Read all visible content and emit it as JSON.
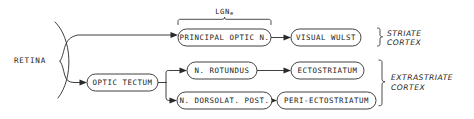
{
  "diagram": {
    "colors": {
      "ink": "#2a2a2a",
      "background": "#ffffff"
    },
    "source_node": {
      "label": "RETINA",
      "shape": "retina-arc"
    },
    "nodes": [
      {
        "id": "principal-optic-n",
        "label": "PRINCIPAL OPTIC N.",
        "x": 178,
        "y": 29,
        "w": 93,
        "h": 17
      },
      {
        "id": "visual-wulst",
        "label": "VISUAL WULST",
        "x": 291,
        "y": 29,
        "w": 70,
        "h": 17
      },
      {
        "id": "optic-tectum",
        "label": "OPTIC TECTUM",
        "x": 87,
        "y": 74,
        "w": 71,
        "h": 17
      },
      {
        "id": "n-rotundus",
        "label": "N. ROTUNDUS",
        "x": 187,
        "y": 62,
        "w": 70,
        "h": 17
      },
      {
        "id": "ectostriatum",
        "label": "ECTOSTRIATUM",
        "x": 291,
        "y": 62,
        "w": 73,
        "h": 17
      },
      {
        "id": "n-dorsolat-post",
        "label": "N. DORSOLAT. POST.",
        "x": 177,
        "y": 92,
        "w": 95,
        "h": 17
      },
      {
        "id": "peri-ectostriatum",
        "label": "PERI-ECTOSTRIATUM",
        "x": 277,
        "y": 92,
        "w": 99,
        "h": 17
      }
    ],
    "annotations": [
      {
        "id": "lgn",
        "text": "LGN",
        "subscript": "e"
      }
    ],
    "groups": [
      {
        "id": "striate-cortex",
        "line1": "STRIATE",
        "line2": "CORTEX"
      },
      {
        "id": "extrastriate-cortex",
        "line1": "EXTRASTRIATE",
        "line2": "CORTEX"
      }
    ],
    "edges": [
      {
        "from": "retina",
        "to": "principal-optic-n"
      },
      {
        "from": "retina",
        "to": "optic-tectum"
      },
      {
        "from": "principal-optic-n",
        "to": "visual-wulst"
      },
      {
        "from": "optic-tectum",
        "to": "n-rotundus"
      },
      {
        "from": "optic-tectum",
        "to": "n-dorsolat-post"
      },
      {
        "from": "n-rotundus",
        "to": "ectostriatum"
      },
      {
        "from": "n-dorsolat-post",
        "to": "peri-ectostriatum"
      }
    ]
  }
}
